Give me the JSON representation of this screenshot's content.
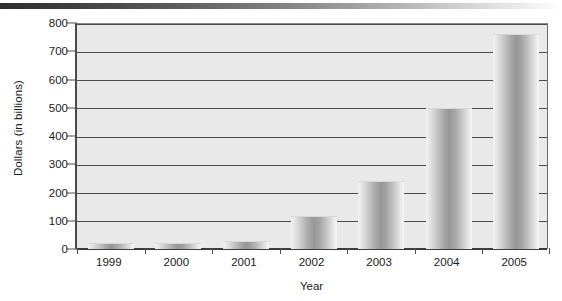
{
  "chart_data": {
    "type": "bar",
    "title": "",
    "xlabel": "Year",
    "ylabel": "Dollars (in billions)",
    "categories": [
      "1999",
      "2000",
      "2001",
      "2002",
      "2003",
      "2004",
      "2005"
    ],
    "values": [
      20,
      20,
      30,
      118,
      240,
      500,
      760
    ],
    "ylim": [
      0,
      800
    ],
    "ytick_values": [
      0,
      100,
      200,
      300,
      400,
      500,
      600,
      700,
      800
    ],
    "ytick_labels": [
      "0",
      "100",
      "200",
      "300",
      "400",
      "500",
      "600",
      "700",
      "800"
    ],
    "grid": "horizontal",
    "legend": "none",
    "series": [
      {
        "name": "Dollars (in billions)",
        "values": [
          20,
          20,
          30,
          118,
          240,
          500,
          760
        ]
      }
    ],
    "colors": {
      "plot_background": "#e9e9e9",
      "gridline": "#4d4d4d",
      "axis": "#3d3d3d",
      "bar_mid": "#969696",
      "bar_edge": "#f2f2f2",
      "text": "#1a1a1a"
    }
  },
  "decor": {
    "top_rule_from": "#2e2e2e",
    "top_rule_to": "#ffffff",
    "scan_remnant_text": "........................................................."
  }
}
